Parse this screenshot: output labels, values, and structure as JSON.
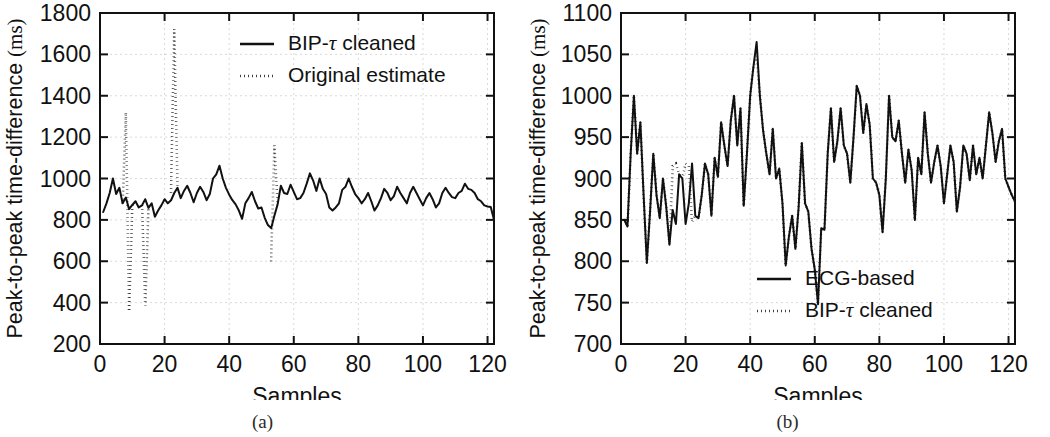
{
  "figure": {
    "panels": [
      {
        "id": "a",
        "subcaption": "(a)",
        "xlabel": "Samples",
        "ylabel_prefix": "Peak-to-peak time-difference ",
        "ylabel_unit": "(ms)",
        "xticks": [
          0,
          20,
          40,
          60,
          80,
          100,
          120
        ],
        "yticks": [
          200,
          400,
          600,
          800,
          1000,
          1200,
          1400,
          1600,
          1800
        ],
        "legend": [
          {
            "label_prefix": "BIP-",
            "label_tau": "τ",
            "label_suffix": " cleaned",
            "style": "solid"
          },
          {
            "label_prefix": "Original estimate",
            "label_tau": "",
            "label_suffix": "",
            "style": "dotted"
          }
        ]
      },
      {
        "id": "b",
        "subcaption": "(b)",
        "xlabel": "Samples",
        "ylabel_prefix": "Peak-to-peak time-difference ",
        "ylabel_unit": "(ms)",
        "xticks": [
          0,
          20,
          40,
          60,
          80,
          100,
          120
        ],
        "yticks": [
          700,
          750,
          800,
          850,
          900,
          950,
          1000,
          1050,
          1100
        ],
        "legend": [
          {
            "label_prefix": "ECG-based",
            "label_tau": "",
            "label_suffix": "",
            "style": "solid"
          },
          {
            "label_prefix": "BIP-",
            "label_tau": "τ",
            "label_suffix": " cleaned",
            "style": "dotted"
          }
        ]
      }
    ]
  },
  "chart_data": [
    {
      "type": "line",
      "panel": "a",
      "title": "",
      "xlabel": "Samples",
      "ylabel": "Peak-to-peak time-difference (ms)",
      "xlim": [
        0,
        122
      ],
      "ylim": [
        200,
        1800
      ],
      "xticks": [
        0,
        20,
        40,
        60,
        80,
        100,
        120
      ],
      "yticks": [
        200,
        400,
        600,
        800,
        1000,
        1200,
        1400,
        1600,
        1800
      ],
      "grid": true,
      "legend_position": "top-right",
      "x": [
        1,
        2,
        3,
        4,
        5,
        6,
        7,
        8,
        9,
        10,
        11,
        12,
        13,
        14,
        15,
        16,
        17,
        18,
        19,
        20,
        21,
        22,
        23,
        24,
        25,
        26,
        27,
        28,
        29,
        30,
        31,
        32,
        33,
        34,
        35,
        36,
        37,
        38,
        39,
        40,
        41,
        42,
        43,
        44,
        45,
        46,
        47,
        48,
        49,
        50,
        51,
        52,
        53,
        54,
        55,
        56,
        57,
        58,
        59,
        60,
        61,
        62,
        63,
        64,
        65,
        66,
        67,
        68,
        69,
        70,
        71,
        72,
        73,
        74,
        75,
        76,
        77,
        78,
        79,
        80,
        81,
        82,
        83,
        84,
        85,
        86,
        87,
        88,
        89,
        90,
        91,
        92,
        93,
        94,
        95,
        96,
        97,
        98,
        99,
        100,
        101,
        102,
        103,
        104,
        105,
        106,
        107,
        108,
        109,
        110,
        111,
        112,
        113,
        114,
        115,
        116,
        117,
        118,
        119,
        120,
        121,
        122
      ],
      "series": [
        {
          "name": "BIP-τ cleaned",
          "style": "solid",
          "values": [
            838,
            880,
            930,
            1000,
            925,
            955,
            880,
            908,
            852,
            872,
            890,
            860,
            870,
            900,
            858,
            880,
            815,
            845,
            870,
            900,
            880,
            895,
            930,
            955,
            905,
            940,
            965,
            930,
            885,
            930,
            960,
            935,
            895,
            925,
            1000,
            1020,
            1062,
            1000,
            955,
            922,
            895,
            875,
            845,
            805,
            880,
            905,
            935,
            890,
            855,
            860,
            810,
            775,
            760,
            820,
            875,
            965,
            930,
            925,
            970,
            935,
            900,
            905,
            930,
            975,
            1025,
            990,
            940,
            1000,
            950,
            925,
            860,
            845,
            860,
            880,
            945,
            960,
            1000,
            960,
            925,
            905,
            880,
            900,
            930,
            890,
            845,
            870,
            905,
            950,
            930,
            895,
            915,
            960,
            930,
            905,
            880,
            930,
            960,
            930,
            900,
            870,
            905,
            930,
            900,
            860,
            880,
            930,
            955,
            930,
            910,
            905,
            930,
            940,
            975,
            950,
            945,
            930,
            900,
            890,
            870,
            865,
            862,
            800,
            755
          ]
        },
        {
          "name": "Original estimate",
          "style": "dotted",
          "segments": [
            {
              "x": [
                7,
                8,
                9
              ],
              "values": [
                880,
                1320,
                365
              ]
            },
            {
              "x": [
                9,
                10
              ],
              "values": [
                365,
                872
              ]
            },
            {
              "x": [
                13,
                14,
                15
              ],
              "values": [
                870,
                385,
                858
              ]
            },
            {
              "x": [
                22,
                23,
                24
              ],
              "values": [
                930,
                1722,
                955
              ]
            },
            {
              "x": [
                53,
                54,
                55
              ],
              "values": [
                600,
                1160,
                875
              ]
            }
          ]
        }
      ],
      "annotations": [
        {
          "text": "dotted original estimate shows outlier spikes near samples 8, 14, 23, 54"
        }
      ]
    },
    {
      "type": "line",
      "panel": "b",
      "title": "",
      "xlabel": "Samples",
      "ylabel": "Peak-to-peak time-difference (ms)",
      "xlim": [
        0,
        122
      ],
      "ylim": [
        700,
        1100
      ],
      "xticks": [
        0,
        20,
        40,
        60,
        80,
        100,
        120
      ],
      "yticks": [
        700,
        750,
        800,
        850,
        900,
        950,
        1000,
        1050,
        1100
      ],
      "grid": true,
      "legend_position": "bottom-right",
      "x": [
        1,
        2,
        3,
        4,
        5,
        6,
        7,
        8,
        9,
        10,
        11,
        12,
        13,
        14,
        15,
        16,
        17,
        18,
        19,
        20,
        21,
        22,
        23,
        24,
        25,
        26,
        27,
        28,
        29,
        30,
        31,
        32,
        33,
        34,
        35,
        36,
        37,
        38,
        39,
        40,
        41,
        42,
        43,
        44,
        45,
        46,
        47,
        48,
        49,
        50,
        51,
        52,
        53,
        54,
        55,
        56,
        57,
        58,
        59,
        60,
        61,
        62,
        63,
        64,
        65,
        66,
        67,
        68,
        69,
        70,
        71,
        72,
        73,
        74,
        75,
        76,
        77,
        78,
        79,
        80,
        81,
        82,
        83,
        84,
        85,
        86,
        87,
        88,
        89,
        90,
        91,
        92,
        93,
        94,
        95,
        96,
        97,
        98,
        99,
        100,
        101,
        102,
        103,
        104,
        105,
        106,
        107,
        108,
        109,
        110,
        111,
        112,
        113,
        114,
        115,
        116,
        117,
        118,
        119,
        120,
        121,
        122
      ],
      "series": [
        {
          "name": "ECG-based",
          "style": "solid",
          "values": [
            850,
            842,
            930,
            1000,
            930,
            968,
            880,
            798,
            860,
            930,
            880,
            852,
            900,
            866,
            820,
            862,
            845,
            905,
            900,
            845,
            870,
            918,
            855,
            852,
            880,
            918,
            905,
            855,
            925,
            902,
            968,
            940,
            915,
            970,
            1000,
            940,
            985,
            867,
            930,
            1000,
            1035,
            1065,
            1000,
            958,
            930,
            905,
            960,
            900,
            912,
            870,
            795,
            830,
            855,
            815,
            865,
            943,
            870,
            860,
            815,
            790,
            748,
            840,
            838,
            930,
            985,
            920,
            945,
            985,
            940,
            930,
            895,
            950,
            1012,
            1000,
            955,
            990,
            965,
            900,
            895,
            880,
            835,
            900,
            1000,
            950,
            945,
            970,
            930,
            895,
            935,
            910,
            850,
            925,
            905,
            980,
            930,
            895,
            920,
            940,
            915,
            870,
            905,
            940,
            920,
            860,
            890,
            940,
            930,
            898,
            940,
            905,
            925,
            900,
            940,
            980,
            955,
            920,
            945,
            960,
            900,
            890,
            880,
            872,
            800,
            748
          ]
        },
        {
          "name": "BIP-τ cleaned",
          "style": "dotted",
          "values": [
            850,
            842,
            930,
            1000,
            930,
            968,
            880,
            798,
            860,
            930,
            880,
            852,
            900,
            866,
            820,
            915,
            918,
            905,
            900,
            918,
            915,
            848,
            855,
            852,
            880,
            918,
            905,
            855,
            925,
            902,
            968,
            940,
            915,
            970,
            1000,
            940,
            985,
            867,
            930,
            1000,
            1035,
            1048,
            1000,
            958,
            930,
            905,
            960,
            900,
            912,
            870,
            795,
            830,
            855,
            815,
            865,
            943,
            870,
            860,
            815,
            790,
            748,
            840,
            838,
            930,
            985,
            920,
            945,
            985,
            940,
            930,
            895,
            950,
            1012,
            1000,
            955,
            990,
            965,
            900,
            895,
            880,
            835,
            900,
            1000,
            950,
            945,
            970,
            930,
            895,
            935,
            910,
            850,
            925,
            905,
            980,
            930,
            895,
            920,
            940,
            915,
            870,
            905,
            940,
            920,
            860,
            890,
            940,
            930,
            898,
            940,
            905,
            925,
            900,
            940,
            980,
            955,
            920,
            945,
            960,
            900,
            890,
            880,
            872,
            800,
            748
          ]
        }
      ],
      "annotations": [
        {
          "text": "dotted BIP-tau cleaned trace deviates from solid ECG-based trace mainly between samples 13 and 23"
        }
      ]
    }
  ]
}
